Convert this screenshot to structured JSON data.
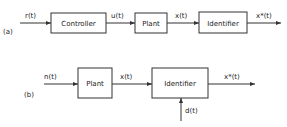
{
  "diagram": {
    "a": {
      "tag": "(a)",
      "blocks": [
        "Controller",
        "Plant",
        "Identifier"
      ],
      "signals": [
        "r(t)",
        "u(t)",
        "x(t)",
        "x*(t)"
      ]
    },
    "b": {
      "tag": "(b)",
      "blocks": [
        "Plant",
        "Identifier"
      ],
      "signals": [
        "n(t)",
        "x(t)",
        "x*(t)"
      ],
      "disturbance": "d(t)"
    }
  }
}
